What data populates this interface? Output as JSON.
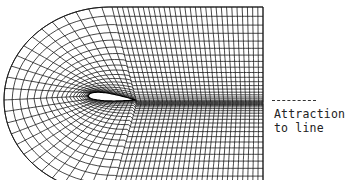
{
  "figure": {
    "type": "C-type body-fitted computational grid around an airfoil with wake",
    "colors": {
      "background": "#ffffff",
      "grid_line": "#1a1a1a",
      "airfoil_fill": "#ffffff"
    },
    "annotation": {
      "line1": "Attraction",
      "line2": "to line",
      "leader_style": "dashed"
    },
    "grid": {
      "outer_boundary": {
        "center": [
          110,
          100
        ],
        "rx": 106,
        "ry": 93,
        "right_x": 263
      },
      "airfoil": {
        "leading_edge": [
          88,
          96
        ],
        "trailing_edge": [
          135,
          100
        ],
        "thickness": 10
      },
      "wake_line_y": 103,
      "radial_line_count_arc": 44,
      "radial_line_count_wake": 20,
      "circumferential_line_count": 22
    }
  }
}
